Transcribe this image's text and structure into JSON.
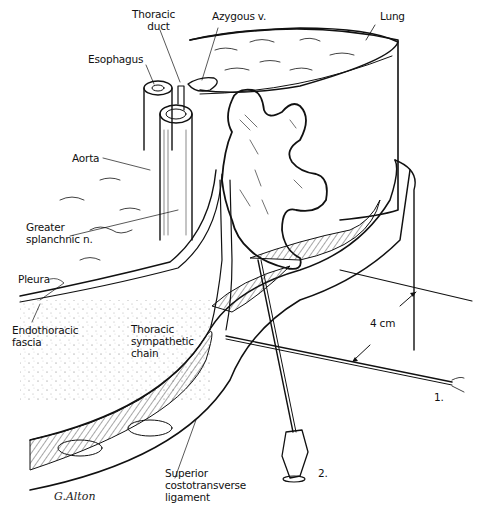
{
  "figure": {
    "type": "anatomical illustration",
    "labels": {
      "thoracic_duct": "Thoracic\nduct",
      "thoracic_duct_l1": "Thoracic",
      "thoracic_duct_l2": "duct",
      "azygous": "Azygous v.",
      "lung": "Lung",
      "esophagus": "Esophagus",
      "aorta": "Aorta",
      "greater_splanchnic_l1": "Greater",
      "greater_splanchnic_l2": "splanchnic n.",
      "pleura": "Pleura",
      "endothoracic_l1": "Endothoracic",
      "endothoracic_l2": "fascia",
      "sympathetic_l1": "Thoracic",
      "sympathetic_l2": "sympathetic",
      "sympathetic_l3": "chain",
      "measurement": "4 cm",
      "needle_1": "1.",
      "needle_2": "2.",
      "ligament_l1": "Superior",
      "ligament_l2": "costotransverse",
      "ligament_l3": "ligament"
    },
    "signature": "G.Alton"
  }
}
